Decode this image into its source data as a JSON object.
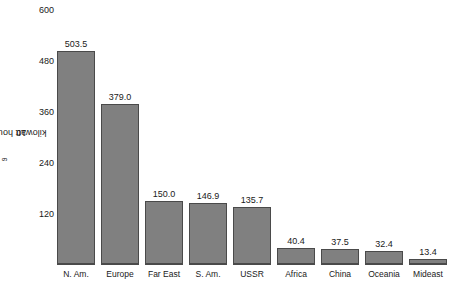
{
  "chart_data": {
    "type": "bar",
    "title": "",
    "subtitle": "",
    "xlabel": "",
    "ylabel": "10⁹ kilowatt hours",
    "ylabel_base": "10",
    "ylabel_exponent": "9",
    "ylabel_suffix": " kilowatt hours",
    "categories": [
      "N. Am.",
      "Europe",
      "Far East",
      "S. Am.",
      "USSR",
      "Africa",
      "China",
      "Oceania",
      "Mideast"
    ],
    "values": [
      503.5,
      379.0,
      150.0,
      146.9,
      135.7,
      40.4,
      37.5,
      32.4,
      13.4
    ],
    "value_labels": [
      "503.5",
      "379.0",
      "150.0",
      "146.9",
      "135.7",
      "40.4",
      "37.5",
      "32.4",
      "13.4"
    ],
    "ylim": [
      0,
      600
    ],
    "yticks": [
      600,
      480,
      360,
      240,
      120
    ],
    "ytick_labels": [
      "600",
      "480",
      "360",
      "240",
      "120"
    ],
    "grid": false,
    "legend": null,
    "bar_color": "#808080",
    "bar_edge_color": "#4a4a4a",
    "text_color": "#1a1a1a",
    "background": "#ffffff"
  }
}
